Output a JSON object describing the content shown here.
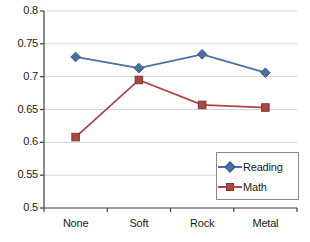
{
  "chart_data": {
    "type": "line",
    "title": "",
    "subtitle": "",
    "xlabel": "",
    "ylabel": "",
    "categories": [
      "None",
      "Soft",
      "Rock",
      "Metal"
    ],
    "series": [
      {
        "name": "Reading",
        "color": "#4A6FA5",
        "marker": "diamond",
        "values": [
          0.73,
          0.713,
          0.734,
          0.706
        ]
      },
      {
        "name": "Math",
        "color": "#AA4643",
        "marker": "square",
        "values": [
          0.608,
          0.695,
          0.657,
          0.653
        ]
      }
    ],
    "ylim": [
      0.5,
      0.8
    ],
    "ytick_labels": [
      "0.8",
      "0.75",
      "0.7",
      "0.65",
      "0.6",
      "0.55",
      "0.5"
    ],
    "ytick_values": [
      0.8,
      0.75,
      0.7,
      0.65,
      0.6,
      0.55,
      0.5
    ],
    "grid": true,
    "grid_axis": "y",
    "grid_color": "#D4D4D4",
    "legend_position": "bottom-right",
    "legend_entries": [
      "Reading",
      "Math"
    ],
    "axis_color": "#3F3F3F",
    "background": "#FFFFFF"
  }
}
